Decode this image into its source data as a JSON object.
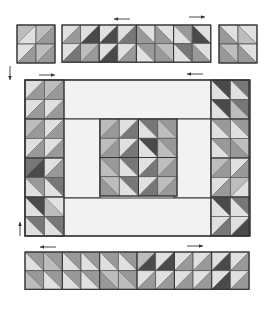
{
  "diagram": {
    "title": "",
    "colors": {
      "outline": "#333333",
      "background": "#f2f2f2",
      "light": "#e0e0e0",
      "medium_light": "#bdbdbd",
      "medium": "#999999",
      "medium_dark": "#777777",
      "dark": "#4a4a4a"
    },
    "arrows": [
      {
        "name": "arrow-top-left",
        "x": 130,
        "y": 19,
        "length": 16,
        "direction": "left"
      },
      {
        "name": "arrow-top-right",
        "x": 205,
        "y": 17,
        "length": 16,
        "direction": "right"
      },
      {
        "name": "arrow-side-down",
        "x": 10,
        "y": 66,
        "length": 14,
        "direction": "down"
      },
      {
        "name": "arrow-frame-top-left",
        "x": 55,
        "y": 75,
        "length": 16,
        "direction": "right"
      },
      {
        "name": "arrow-frame-top-right",
        "x": 203,
        "y": 74,
        "length": 16,
        "direction": "left"
      },
      {
        "name": "arrow-side-up",
        "x": 20,
        "y": 236,
        "length": 14,
        "direction": "up"
      },
      {
        "name": "arrow-bottom-left",
        "x": 56,
        "y": 247,
        "length": 16,
        "direction": "left"
      },
      {
        "name": "arrow-bottom-right",
        "x": 203,
        "y": 246,
        "length": 16,
        "direction": "right"
      }
    ],
    "units": [
      {
        "name": "top-left-block",
        "x": 17,
        "y": 25,
        "cols": 2,
        "rows": 2,
        "cell": 19,
        "cells": [
          [
            "ne",
            "medium_light",
            "light"
          ],
          [
            "ne",
            "medium_light",
            "medium"
          ],
          [
            "ne",
            "light",
            "medium"
          ],
          [
            "ne",
            "medium_light",
            "medium"
          ]
        ]
      },
      {
        "name": "top-middle-strip",
        "x": 62,
        "y": 25,
        "cols": 8,
        "rows": 2,
        "cell": 18.6,
        "cells": [
          [
            "ne",
            "light",
            "medium"
          ],
          [
            "ne",
            "light",
            "dark"
          ],
          [
            "ne",
            "light",
            "dark"
          ],
          [
            "ne",
            "light",
            "medium_dark"
          ],
          [
            "nw",
            "light",
            "medium"
          ],
          [
            "nw",
            "light",
            "medium"
          ],
          [
            "nw",
            "medium",
            "light"
          ],
          [
            "nw",
            "light",
            "dark"
          ],
          [
            "ne",
            "light",
            "medium_dark"
          ],
          [
            "ne",
            "medium_light",
            "medium"
          ],
          [
            "ne",
            "light",
            "dark"
          ],
          [
            "ne",
            "light",
            "medium"
          ],
          [
            "nw",
            "medium",
            "light"
          ],
          [
            "nw",
            "medium_light",
            "medium"
          ],
          [
            "nw",
            "medium_dark",
            "light"
          ],
          [
            "nw",
            "light",
            "medium"
          ]
        ]
      },
      {
        "name": "top-right-block",
        "x": 219,
        "y": 25,
        "cols": 2,
        "rows": 2,
        "cell": 19,
        "cells": [
          [
            "nw",
            "light",
            "medium"
          ],
          [
            "nw",
            "light",
            "medium_light"
          ],
          [
            "nw",
            "medium_light",
            "medium"
          ],
          [
            "nw",
            "light",
            "medium"
          ]
        ]
      },
      {
        "name": "left-column",
        "x": 25,
        "y": 80,
        "cols": 2,
        "rows": 8,
        "cell": 19.5,
        "cells": [
          [
            "ne",
            "light",
            "medium"
          ],
          [
            "ne",
            "medium_light",
            "medium"
          ],
          [
            "ne",
            "light",
            "medium"
          ],
          [
            "ne",
            "light",
            "medium"
          ],
          [
            "ne",
            "medium_light",
            "medium"
          ],
          [
            "ne",
            "light",
            "medium"
          ],
          [
            "ne",
            "light",
            "medium"
          ],
          [
            "ne",
            "light",
            "medium"
          ],
          [
            "ne",
            "medium_dark",
            "dark"
          ],
          [
            "ne",
            "light",
            "medium"
          ],
          [
            "nw",
            "medium",
            "light"
          ],
          [
            "nw",
            "medium_dark",
            "light"
          ],
          [
            "nw",
            "dark",
            "light"
          ],
          [
            "nw",
            "light",
            "medium_light"
          ],
          [
            "nw",
            "medium_dark",
            "light"
          ],
          [
            "nw",
            "medium_dark",
            "light"
          ]
        ]
      },
      {
        "name": "right-column",
        "x": 211,
        "y": 80,
        "cols": 2,
        "rows": 8,
        "cell": 19.5,
        "cells": [
          [
            "nw",
            "dark",
            "light"
          ],
          [
            "nw",
            "medium_dark",
            "light"
          ],
          [
            "nw",
            "dark",
            "light"
          ],
          [
            "nw",
            "medium_dark",
            "medium_light"
          ],
          [
            "nw",
            "medium",
            "light"
          ],
          [
            "nw",
            "medium",
            "light"
          ],
          [
            "nw",
            "medium",
            "light"
          ],
          [
            "nw",
            "medium_light",
            "medium"
          ],
          [
            "ne",
            "medium_light",
            "medium"
          ],
          [
            "ne",
            "light",
            "medium"
          ],
          [
            "ne",
            "light",
            "medium"
          ],
          [
            "ne",
            "medium_light",
            "light"
          ],
          [
            "nw",
            "dark",
            "light"
          ],
          [
            "nw",
            "medium_dark",
            "light"
          ],
          [
            "ne",
            "light",
            "medium_dark"
          ],
          [
            "ne",
            "light",
            "dark"
          ]
        ]
      },
      {
        "name": "center-medallion",
        "x": 100,
        "y": 119,
        "cols": 4,
        "rows": 4,
        "cell": 19.25,
        "cells": [
          [
            "ne",
            "medium_light",
            "medium"
          ],
          [
            "ne",
            "light",
            "medium_dark"
          ],
          [
            "nw",
            "medium_dark",
            "light"
          ],
          [
            "nw",
            "medium",
            "medium_light"
          ],
          [
            "ne",
            "medium_light",
            "medium"
          ],
          [
            "ne",
            "light",
            "medium_dark"
          ],
          [
            "nw",
            "dark",
            "light"
          ],
          [
            "nw",
            "medium",
            "medium_light"
          ],
          [
            "nw",
            "medium",
            "medium_light"
          ],
          [
            "nw",
            "medium_dark",
            "light"
          ],
          [
            "ne",
            "light",
            "medium_dark"
          ],
          [
            "ne",
            "medium_light",
            "medium"
          ],
          [
            "nw",
            "medium_light",
            "medium"
          ],
          [
            "nw",
            "medium_dark",
            "light"
          ],
          [
            "ne",
            "light",
            "medium_dark"
          ],
          [
            "ne",
            "medium_light",
            "medium"
          ]
        ]
      },
      {
        "name": "bottom-strip",
        "x": 25,
        "y": 252,
        "cols": 12,
        "rows": 2,
        "cell": 18.67,
        "cells": [
          [
            "nw",
            "medium",
            "light"
          ],
          [
            "nw",
            "medium",
            "medium_light"
          ],
          [
            "nw",
            "medium",
            "light"
          ],
          [
            "nw",
            "medium",
            "light"
          ],
          [
            "nw",
            "medium",
            "light"
          ],
          [
            "nw",
            "medium",
            "light"
          ],
          [
            "ne",
            "medium_light",
            "dark"
          ],
          [
            "ne",
            "light",
            "dark"
          ],
          [
            "ne",
            "light",
            "medium"
          ],
          [
            "ne",
            "light",
            "medium"
          ],
          [
            "ne",
            "light",
            "dark"
          ],
          [
            "ne",
            "light",
            "medium"
          ],
          [
            "nw",
            "medium",
            "medium_light"
          ],
          [
            "nw",
            "medium",
            "light"
          ],
          [
            "nw",
            "medium",
            "light"
          ],
          [
            "nw",
            "medium",
            "light"
          ],
          [
            "nw",
            "medium_light",
            "medium"
          ],
          [
            "nw",
            "medium",
            "medium_light"
          ],
          [
            "ne",
            "light",
            "medium"
          ],
          [
            "ne",
            "light",
            "medium"
          ],
          [
            "ne",
            "light",
            "medium"
          ],
          [
            "ne",
            "light",
            "medium"
          ],
          [
            "ne",
            "light",
            "dark"
          ],
          [
            "ne",
            "light",
            "medium"
          ]
        ]
      }
    ],
    "plain_panels": [
      {
        "name": "top-sashing-panel",
        "x": 63,
        "y": 80,
        "w": 148,
        "h": 39
      },
      {
        "name": "left-inner-panel",
        "x": 63,
        "y": 119,
        "w": 37,
        "h": 79
      },
      {
        "name": "right-inner-panel",
        "x": 174,
        "y": 119,
        "w": 37,
        "h": 79
      },
      {
        "name": "bottom-sashing-panel",
        "x": 63,
        "y": 198,
        "w": 148,
        "h": 38
      }
    ],
    "frame": {
      "name": "quilt-frame",
      "x": 25,
      "y": 80,
      "w": 224,
      "h": 156
    }
  }
}
